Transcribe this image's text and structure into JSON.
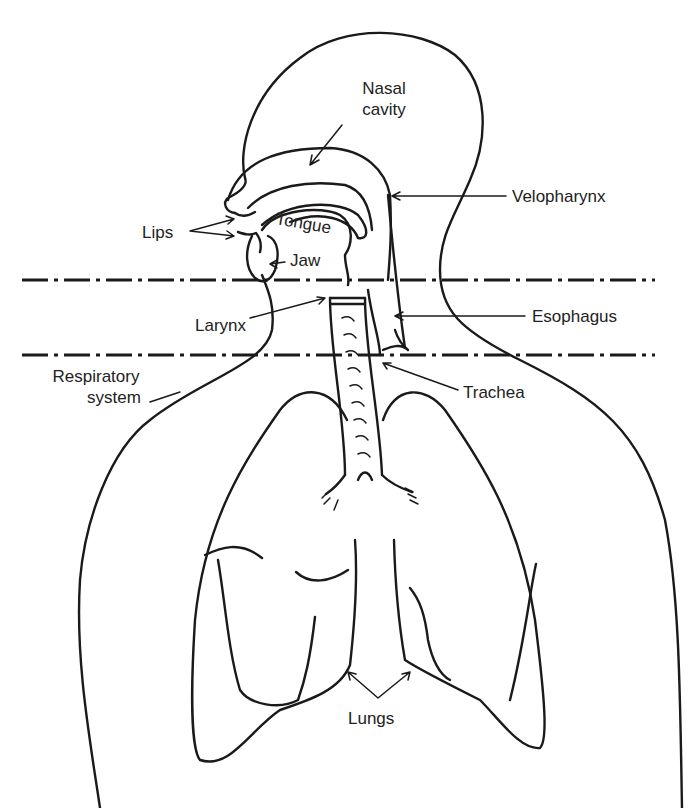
{
  "diagram": {
    "colors": {
      "line": "#1a1a1a",
      "text": "#222222",
      "background": "#ffffff"
    },
    "boundaries": [
      {
        "name": "upper-boundary",
        "style": "dash-dot",
        "y": 280
      },
      {
        "name": "lower-boundary",
        "style": "dash-dot",
        "y": 355
      }
    ],
    "labels": {
      "nasal_cavity_1": "Nasal",
      "nasal_cavity_2": "cavity",
      "velopharynx": "Velopharynx",
      "lips": "Lips",
      "tongue": "Tongue",
      "jaw": "Jaw",
      "larynx": "Larynx",
      "esophagus": "Esophagus",
      "respiratory_1": "Respiratory",
      "respiratory_2": "system",
      "trachea": "Trachea",
      "lungs": "Lungs"
    }
  }
}
